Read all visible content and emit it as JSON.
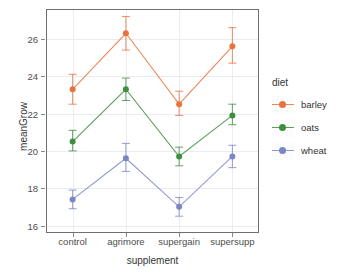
{
  "chart_data": {
    "type": "line",
    "title": "",
    "xlabel": "supplement",
    "ylabel": "meanGrow",
    "categories": [
      "control",
      "agrimore",
      "supergain",
      "supersupp"
    ],
    "ylim": [
      15.6,
      27.6
    ],
    "yticks": [
      16,
      18,
      20,
      22,
      24,
      26
    ],
    "grid": true,
    "legend_title": "diet",
    "legend_position": "right",
    "errorbars": true,
    "series": [
      {
        "name": "barley",
        "color": "#E8743B",
        "values": [
          23.3,
          26.3,
          22.5,
          25.6
        ],
        "err_low": [
          22.5,
          25.4,
          21.9,
          24.7
        ],
        "err_high": [
          24.1,
          27.2,
          23.2,
          26.6
        ]
      },
      {
        "name": "oats",
        "color": "#3E8E3E",
        "values": [
          20.5,
          23.3,
          19.7,
          21.9
        ],
        "err_low": [
          20.0,
          22.7,
          19.2,
          21.4
        ],
        "err_high": [
          21.1,
          23.9,
          20.2,
          22.5
        ]
      },
      {
        "name": "wheat",
        "color": "#7B87C4",
        "values": [
          17.4,
          19.6,
          17.0,
          19.7
        ],
        "err_low": [
          16.9,
          18.9,
          16.5,
          19.1
        ],
        "err_high": [
          17.9,
          20.4,
          17.5,
          20.3
        ]
      }
    ]
  },
  "legend": {
    "title": "diet",
    "items": [
      {
        "label": "barley",
        "color": "#E8743B"
      },
      {
        "label": "oats",
        "color": "#3E8E3E"
      },
      {
        "label": "wheat",
        "color": "#7B87C4"
      }
    ]
  }
}
